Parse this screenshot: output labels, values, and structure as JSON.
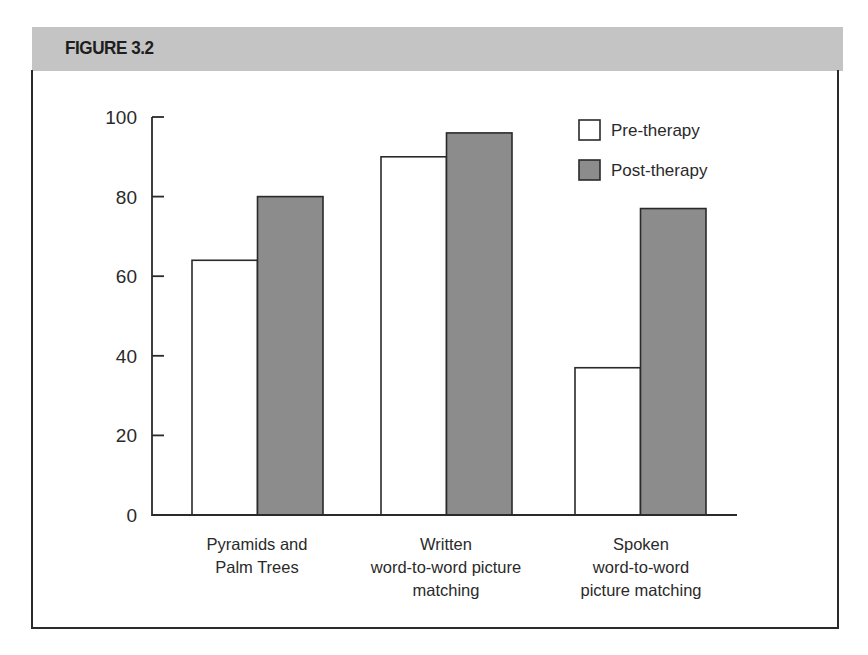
{
  "figure": {
    "title": "FIGURE 3.2"
  },
  "colors": {
    "pre": "#ffffff",
    "post": "#8c8c8c",
    "outline": "#2a2a2a",
    "header_band": "#c4c4c4"
  },
  "legend": {
    "items": [
      {
        "label": "Pre-therapy",
        "color": "#ffffff"
      },
      {
        "label": "Post-therapy",
        "color": "#8c8c8c"
      }
    ]
  },
  "y_axis": {
    "ticks": [
      "0",
      "20",
      "40",
      "60",
      "80",
      "100"
    ]
  },
  "x_axis": {
    "categories": [
      {
        "lines": [
          "Pyramids and",
          "Palm Trees"
        ]
      },
      {
        "lines": [
          "Written",
          "word-to-word picture",
          "matching"
        ]
      },
      {
        "lines": [
          "Spoken",
          "word-to-word",
          "picture matching"
        ]
      }
    ]
  },
  "chart_data": {
    "type": "bar",
    "title": "FIGURE 3.2",
    "categories": [
      "Pyramids and Palm Trees",
      "Written word-to-word picture matching",
      "Spoken word-to-word picture matching"
    ],
    "series": [
      {
        "name": "Pre-therapy",
        "values": [
          64,
          90,
          37
        ]
      },
      {
        "name": "Post-therapy",
        "values": [
          80,
          96,
          77
        ]
      }
    ],
    "xlabel": "",
    "ylabel": "",
    "ylim": [
      0,
      100
    ],
    "yticks": [
      0,
      20,
      40,
      60,
      80,
      100
    ],
    "grid": false,
    "legend_position": "top-right"
  }
}
